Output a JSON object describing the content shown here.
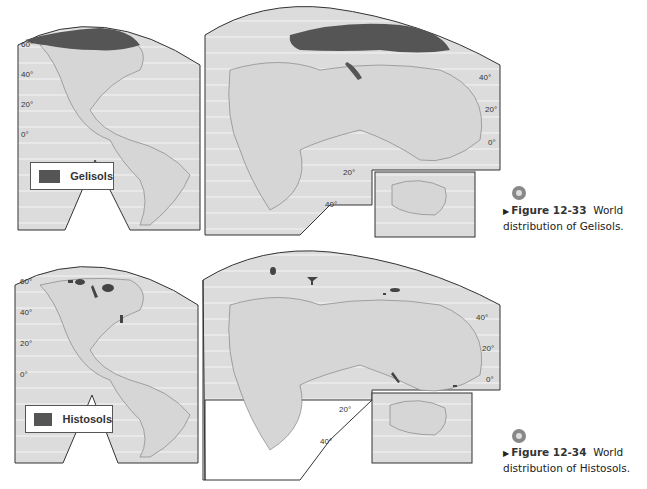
{
  "figures": [
    {
      "id": "12-33",
      "legend_label": "Gelisols",
      "legend_color": "#555555",
      "caption_number": "Figure 12-33",
      "caption_line1": "World",
      "caption_line2": "distribution of Gelisols.",
      "latitudes_left": [
        "60°",
        "40°",
        "20°",
        "0°"
      ],
      "latitudes_right": [
        "40°",
        "20°",
        "0°"
      ],
      "latitudes_south": [
        "20°",
        "40°"
      ]
    },
    {
      "id": "12-34",
      "legend_label": "Histosols",
      "legend_color": "#555555",
      "caption_number": "Figure 12-34",
      "caption_line1": "World",
      "caption_line2": "distribution of Histosols.",
      "latitudes_left": [
        "60°",
        "40°",
        "20°",
        "0°"
      ],
      "latitudes_right": [
        "40°",
        "20°",
        "0°"
      ],
      "latitudes_south": [
        "20°",
        "40°"
      ]
    }
  ],
  "colors": {
    "land": "#d9d9d9",
    "ocean": "#e6e6e6",
    "soil": "#555555",
    "border": "#333333"
  }
}
